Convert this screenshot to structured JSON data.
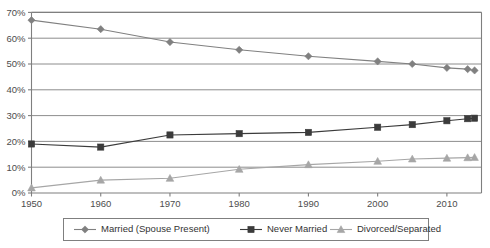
{
  "chart_data": {
    "type": "line",
    "title": "",
    "subtitle": "",
    "xlabel": "",
    "ylabel": "",
    "x": [
      1950,
      1960,
      1970,
      1980,
      1990,
      2000,
      2005,
      2010,
      2013,
      2014
    ],
    "xlim": [
      1950,
      2015
    ],
    "ylim": [
      0,
      70
    ],
    "xticks": [
      1950,
      1960,
      1970,
      1980,
      1990,
      2000,
      2010
    ],
    "xtick_labels": [
      "1950",
      "1960",
      "1970",
      "1980",
      "1990",
      "2000",
      "2010"
    ],
    "yticks": [
      0,
      10,
      20,
      30,
      40,
      50,
      60,
      70
    ],
    "ytick_labels": [
      "0%",
      "10%",
      "20%",
      "30%",
      "40%",
      "50%",
      "60%",
      "70%"
    ],
    "grid": true,
    "grid_axis": "y",
    "legend_position": "bottom",
    "series": [
      {
        "name": "Married (Spouse Present)",
        "marker": "diamond",
        "color": "#808080",
        "values": [
          67.0,
          63.5,
          58.5,
          55.5,
          53.0,
          51.0,
          50.0,
          48.5,
          48.0,
          47.5
        ]
      },
      {
        "name": "Never Married",
        "marker": "square",
        "color": "#3b3b3b",
        "values": [
          19.0,
          17.8,
          22.5,
          23.0,
          23.5,
          25.5,
          26.5,
          28.0,
          28.8,
          29.0
        ]
      },
      {
        "name": "Divorced/Separated",
        "marker": "triangle",
        "color": "#a6a6a6",
        "values": [
          2.0,
          5.0,
          5.7,
          9.2,
          11.0,
          12.3,
          13.2,
          13.5,
          13.7,
          13.8
        ]
      }
    ]
  },
  "legend": {
    "items": [
      {
        "label": "Married (Spouse Present)"
      },
      {
        "label": "Never Married"
      },
      {
        "label": "Divorced/Separated"
      }
    ]
  },
  "colors": {
    "axis": "#7f7f7f",
    "grid": "#808080",
    "plot_border": "#7f7f7f",
    "legend_border": "#7f7f7f",
    "text": "#4d4d4d",
    "background": "#ffffff"
  }
}
